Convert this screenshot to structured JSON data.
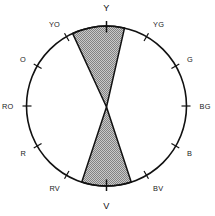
{
  "figure": {
    "type": "color-wheel-diagram",
    "shape": "circle",
    "center": {
      "x": 106.5,
      "y": 106.0
    },
    "radius": 80.0,
    "stroke_color": "#111111",
    "background_color": "#ffffff"
  },
  "wedge": {
    "name": "shaded-bowtie-region",
    "description": "Two opposed shaded triangular wedges meeting at the circle center, spanning the Y to V axis",
    "fill_color": "#a8a8a8",
    "pattern": "checkerboard-dither",
    "stroke_color": "#111111",
    "apex": {
      "x": 106.5,
      "y": 107.0
    },
    "upper": {
      "label": "upper-wedge",
      "start_angle_deg": 77,
      "end_angle_deg": 115
    },
    "lower": {
      "label": "lower-wedge",
      "start_angle_deg": 252,
      "end_angle_deg": 288
    }
  },
  "hues": [
    {
      "id": "Y",
      "label": "Y",
      "angle_deg": 90,
      "size": "major",
      "tick": true
    },
    {
      "id": "YG",
      "label": "YG",
      "angle_deg": 60,
      "size": "minor",
      "tick": true
    },
    {
      "id": "G",
      "label": "G",
      "angle_deg": 30,
      "size": "minor",
      "tick": true
    },
    {
      "id": "BG",
      "label": "BG",
      "angle_deg": 0,
      "size": "minor",
      "tick": true
    },
    {
      "id": "B",
      "label": "B",
      "angle_deg": 330,
      "size": "minor",
      "tick": true
    },
    {
      "id": "BV",
      "label": "BV",
      "angle_deg": 300,
      "size": "minor",
      "tick": true
    },
    {
      "id": "V",
      "label": "V",
      "angle_deg": 270,
      "size": "major",
      "tick": true
    },
    {
      "id": "RV",
      "label": "RV",
      "angle_deg": 240,
      "size": "minor",
      "tick": true
    },
    {
      "id": "R",
      "label": "R",
      "angle_deg": 210,
      "size": "minor",
      "tick": true
    },
    {
      "id": "RO",
      "label": "RO",
      "angle_deg": 180,
      "size": "minor",
      "tick": true
    },
    {
      "id": "O",
      "label": "O",
      "angle_deg": 150,
      "size": "minor",
      "tick": true
    },
    {
      "id": "YO",
      "label": "YO",
      "angle_deg": 120,
      "size": "minor",
      "tick": true
    }
  ]
}
